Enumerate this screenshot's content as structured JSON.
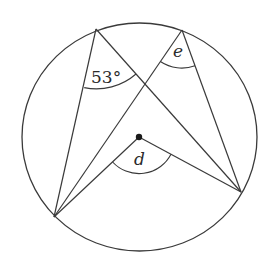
{
  "diagram": {
    "type": "circle-theorem",
    "circle": {
      "cx": 139.5,
      "cy": 137,
      "rx": 117.5,
      "ry": 114
    },
    "points": {
      "A": {
        "x": 96,
        "y": 29
      },
      "B": {
        "x": 182,
        "y": 30
      },
      "C": {
        "x": 54,
        "y": 217
      },
      "D": {
        "x": 241,
        "y": 192
      },
      "O": {
        "x": 139,
        "y": 137
      }
    },
    "segments": [
      [
        "A",
        "C"
      ],
      [
        "A",
        "D"
      ],
      [
        "B",
        "C"
      ],
      [
        "B",
        "D"
      ],
      [
        "O",
        "C"
      ],
      [
        "O",
        "D"
      ]
    ],
    "angles": [
      {
        "vertex": "A",
        "label": "53°",
        "value": 53,
        "unit": "degrees",
        "known": true
      },
      {
        "vertex": "B",
        "label": "e",
        "known": false
      },
      {
        "vertex": "O",
        "label": "d",
        "known": false
      }
    ],
    "labels": {
      "angle_a": "53°",
      "angle_b": "e",
      "angle_o": "d"
    },
    "stroke_color": "#3a3a3a",
    "background": "#ffffff"
  }
}
